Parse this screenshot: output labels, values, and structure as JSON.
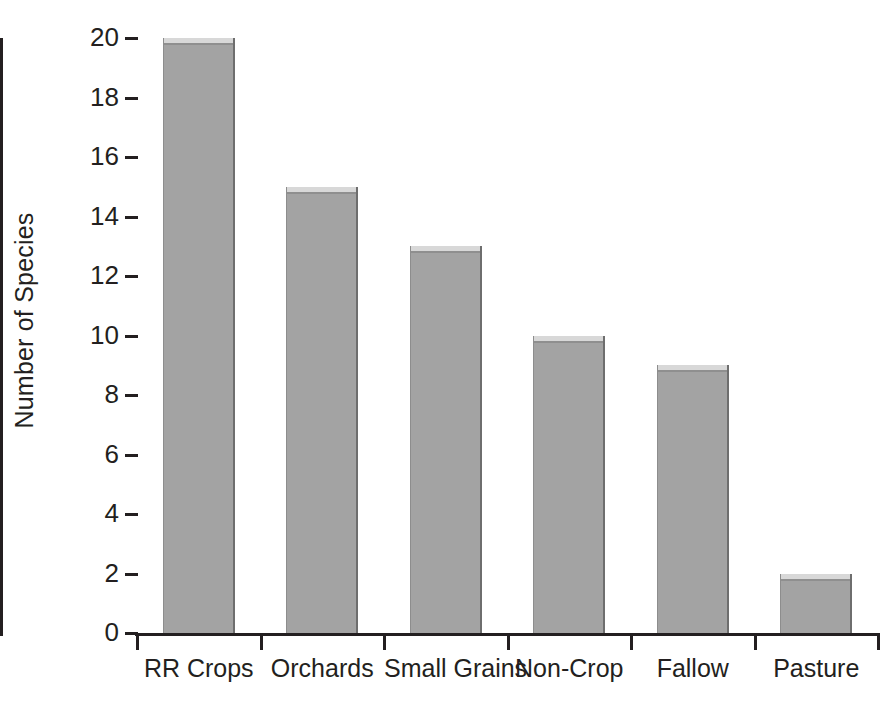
{
  "chart_data": {
    "type": "bar",
    "title": "",
    "xlabel": "",
    "ylabel": "Number of Species",
    "categories": [
      "RR Crops",
      "Orchards",
      "Small Grains",
      "Non-Crop",
      "Fallow",
      "Pasture"
    ],
    "values": [
      20,
      15,
      13,
      10,
      9,
      2
    ],
    "series": [
      {
        "name": "Number of Species",
        "values": [
          20,
          15,
          13,
          10,
          9,
          2
        ]
      }
    ],
    "ylim": [
      0,
      20
    ],
    "xlim": [
      0,
      6
    ],
    "y_ticks": [
      0,
      2,
      4,
      6,
      8,
      10,
      12,
      14,
      16,
      18,
      20
    ],
    "y_tick_labels": [
      "0",
      "2",
      "4",
      "6",
      "8",
      "10",
      "12",
      "14",
      "16",
      "18",
      "20"
    ],
    "y_tick_interval": 2,
    "grid": false,
    "legend": false,
    "legend_position": "none",
    "bar_color": "#a3a3a3",
    "bar_edge_color": "#6e6e6e",
    "bar_highlight_color": "#d8d8d8",
    "axis_color": "#231f20",
    "background_color": "#ffffff",
    "annotations": []
  },
  "caption": {
    "text": ""
  }
}
